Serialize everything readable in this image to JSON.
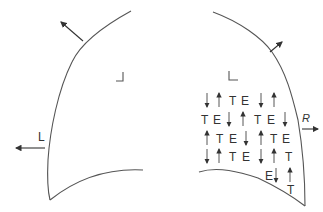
{
  "diagram": {
    "left_panel": {
      "label": "L",
      "corner_mark": "┘",
      "arrows": [
        "outward-up-left",
        "left"
      ]
    },
    "right_panel": {
      "label": "R",
      "corner_mark": "L",
      "arrows": [
        "outward-up-right",
        "right"
      ],
      "grid": [
        {
          "y": 105,
          "cells": [
            {
              "x": 204,
              "t": "↓"
            },
            {
              "x": 216,
              "t": "↑"
            },
            {
              "x": 229,
              "t": "T"
            },
            {
              "x": 241,
              "t": "E"
            },
            {
              "x": 258,
              "t": "↓"
            },
            {
              "x": 271,
              "t": "↑"
            }
          ]
        },
        {
          "y": 124,
          "cells": [
            {
              "x": 201,
              "t": "T"
            },
            {
              "x": 213,
              "t": "E"
            },
            {
              "x": 226,
              "t": "↓"
            },
            {
              "x": 240,
              "t": "↑"
            },
            {
              "x": 254,
              "t": "T"
            },
            {
              "x": 267,
              "t": "E"
            },
            {
              "x": 282,
              "t": "↓"
            }
          ]
        },
        {
          "y": 143,
          "cells": [
            {
              "x": 204,
              "t": "↑"
            },
            {
              "x": 216,
              "t": "T"
            },
            {
              "x": 229,
              "t": "E"
            },
            {
              "x": 243,
              "t": "↓"
            },
            {
              "x": 258,
              "t": "↑"
            },
            {
              "x": 270,
              "t": "T"
            },
            {
              "x": 282,
              "t": "E"
            }
          ]
        },
        {
          "y": 161,
          "cells": [
            {
              "x": 204,
              "t": "↓"
            },
            {
              "x": 216,
              "t": "↑"
            },
            {
              "x": 229,
              "t": "T"
            },
            {
              "x": 242,
              "t": "E"
            },
            {
              "x": 258,
              "t": "↓"
            },
            {
              "x": 271,
              "t": "↑"
            },
            {
              "x": 285,
              "t": "T"
            }
          ]
        },
        {
          "y": 180,
          "cells": [
            {
              "x": 265,
              "t": "E"
            },
            {
              "x": 273,
              "t": "↓"
            },
            {
              "x": 287,
              "t": "↑"
            }
          ]
        },
        {
          "y": 194,
          "cells": [
            {
              "x": 287,
              "t": "T"
            }
          ]
        }
      ]
    }
  }
}
